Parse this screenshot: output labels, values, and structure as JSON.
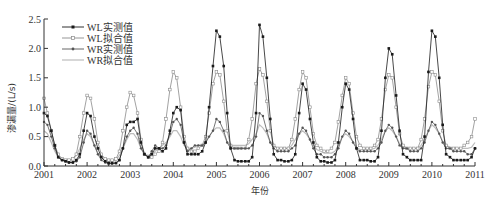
{
  "chart_data": {
    "type": "line",
    "title": "",
    "xlabel": "年份",
    "ylabel": "渗漏量/(L/s)",
    "xlim": [
      2001,
      2011
    ],
    "ylim": [
      0,
      2.5
    ],
    "xticks": [
      "2001",
      "2002",
      "2003",
      "2004",
      "2005",
      "2006",
      "2007",
      "2008",
      "2009",
      "2010",
      "2011"
    ],
    "yticks": [
      "0.0",
      "0.5",
      "1.0",
      "1.5",
      "2.0",
      "2.5"
    ],
    "grid": false,
    "legend_position": "upper-left",
    "x": [
      2001.0,
      2001.08,
      2001.17,
      2001.25,
      2001.33,
      2001.42,
      2001.5,
      2001.58,
      2001.67,
      2001.75,
      2001.83,
      2001.92,
      2002.0,
      2002.08,
      2002.17,
      2002.25,
      2002.33,
      2002.42,
      2002.5,
      2002.58,
      2002.67,
      2002.75,
      2002.83,
      2002.92,
      2003.0,
      2003.08,
      2003.17,
      2003.25,
      2003.33,
      2003.42,
      2003.5,
      2003.58,
      2003.67,
      2003.75,
      2003.83,
      2003.92,
      2004.0,
      2004.08,
      2004.17,
      2004.25,
      2004.33,
      2004.42,
      2004.5,
      2004.58,
      2004.67,
      2004.75,
      2004.83,
      2004.92,
      2005.0,
      2005.08,
      2005.17,
      2005.25,
      2005.33,
      2005.42,
      2005.5,
      2005.58,
      2005.67,
      2005.75,
      2005.83,
      2005.92,
      2006.0,
      2006.08,
      2006.17,
      2006.25,
      2006.33,
      2006.42,
      2006.5,
      2006.58,
      2006.67,
      2006.75,
      2006.83,
      2006.92,
      2007.0,
      2007.08,
      2007.17,
      2007.25,
      2007.33,
      2007.42,
      2007.5,
      2007.58,
      2007.67,
      2007.75,
      2007.83,
      2007.92,
      2008.0,
      2008.08,
      2008.17,
      2008.25,
      2008.33,
      2008.42,
      2008.5,
      2008.58,
      2008.67,
      2008.75,
      2008.83,
      2008.92,
      2009.0,
      2009.08,
      2009.17,
      2009.25,
      2009.33,
      2009.42,
      2009.5,
      2009.58,
      2009.67,
      2009.75,
      2009.83,
      2009.92,
      2010.0,
      2010.08,
      2010.17,
      2010.25,
      2010.33,
      2010.42,
      2010.5,
      2010.58,
      2010.67,
      2010.75,
      2010.83,
      2010.92,
      2011.0
    ],
    "series": [
      {
        "name": "WL实测值",
        "color": "#1a1a1a",
        "marker": "square",
        "values": [
          0.9,
          0.85,
          0.6,
          0.35,
          0.15,
          0.1,
          0.08,
          0.06,
          0.06,
          0.1,
          0.2,
          0.6,
          0.9,
          0.85,
          0.5,
          0.3,
          0.15,
          0.08,
          0.05,
          0.05,
          0.05,
          0.1,
          0.3,
          0.7,
          0.75,
          0.75,
          0.8,
          0.4,
          0.2,
          0.15,
          0.2,
          0.3,
          0.3,
          0.25,
          0.3,
          0.6,
          0.9,
          1.0,
          0.95,
          0.4,
          0.2,
          0.2,
          0.2,
          0.2,
          0.25,
          0.4,
          1.0,
          1.7,
          2.3,
          2.2,
          1.7,
          0.9,
          0.3,
          0.1,
          0.08,
          0.08,
          0.08,
          0.08,
          0.15,
          0.9,
          2.4,
          2.2,
          1.5,
          0.8,
          0.2,
          0.1,
          0.1,
          0.08,
          0.08,
          0.1,
          0.2,
          0.9,
          1.4,
          1.3,
          0.8,
          0.4,
          0.15,
          0.08,
          0.08,
          0.06,
          0.06,
          0.1,
          0.4,
          1.0,
          1.4,
          1.3,
          0.8,
          0.3,
          0.1,
          0.1,
          0.1,
          0.08,
          0.08,
          0.15,
          0.6,
          1.5,
          2.0,
          1.9,
          1.2,
          0.6,
          0.2,
          0.15,
          0.1,
          0.1,
          0.1,
          0.1,
          0.5,
          1.6,
          2.3,
          2.2,
          1.5,
          0.7,
          0.2,
          0.15,
          0.1,
          0.1,
          0.1,
          0.1,
          0.1,
          0.15,
          0.3
        ]
      },
      {
        "name": "WL拟合值",
        "color": "#8a8a8a",
        "marker": "open-square",
        "values": [
          1.15,
          0.9,
          0.6,
          0.35,
          0.2,
          0.12,
          0.1,
          0.1,
          0.12,
          0.2,
          0.5,
          0.9,
          1.2,
          1.15,
          0.8,
          0.4,
          0.2,
          0.12,
          0.1,
          0.1,
          0.12,
          0.25,
          0.6,
          1.0,
          1.25,
          1.2,
          0.9,
          0.45,
          0.2,
          0.15,
          0.15,
          0.2,
          0.25,
          0.4,
          0.8,
          1.3,
          1.6,
          1.5,
          1.0,
          0.5,
          0.3,
          0.25,
          0.25,
          0.3,
          0.35,
          0.5,
          0.9,
          1.4,
          1.6,
          1.55,
          1.1,
          0.6,
          0.35,
          0.3,
          0.3,
          0.3,
          0.3,
          0.45,
          0.8,
          1.4,
          1.65,
          1.55,
          1.1,
          0.6,
          0.35,
          0.3,
          0.3,
          0.3,
          0.3,
          0.45,
          0.8,
          1.3,
          1.6,
          1.5,
          1.0,
          0.55,
          0.35,
          0.3,
          0.25,
          0.25,
          0.3,
          0.4,
          0.75,
          1.2,
          1.5,
          1.4,
          0.9,
          0.5,
          0.35,
          0.3,
          0.3,
          0.3,
          0.35,
          0.45,
          0.8,
          1.3,
          1.55,
          1.5,
          1.0,
          0.55,
          0.35,
          0.3,
          0.3,
          0.3,
          0.3,
          0.45,
          0.8,
          1.35,
          1.6,
          1.55,
          1.1,
          0.6,
          0.35,
          0.3,
          0.3,
          0.3,
          0.3,
          0.35,
          0.4,
          0.5,
          0.8
        ]
      },
      {
        "name": "WR实测值",
        "color": "#555555",
        "marker": "star",
        "values": [
          0.75,
          0.7,
          0.5,
          0.3,
          0.15,
          0.1,
          0.08,
          0.06,
          0.06,
          0.08,
          0.15,
          0.4,
          0.6,
          0.55,
          0.35,
          0.2,
          0.1,
          0.06,
          0.04,
          0.04,
          0.05,
          0.1,
          0.3,
          0.5,
          0.6,
          0.65,
          0.55,
          0.3,
          0.2,
          0.15,
          0.25,
          0.35,
          0.3,
          0.3,
          0.35,
          0.55,
          0.75,
          0.8,
          0.7,
          0.4,
          0.25,
          0.3,
          0.35,
          0.35,
          0.35,
          0.4,
          0.5,
          0.6,
          0.8,
          0.75,
          0.6,
          0.4,
          0.3,
          0.3,
          0.3,
          0.3,
          0.3,
          0.3,
          0.35,
          0.5,
          0.9,
          0.85,
          0.6,
          0.4,
          0.3,
          0.25,
          0.25,
          0.25,
          0.25,
          0.3,
          0.35,
          0.55,
          0.65,
          0.6,
          0.45,
          0.3,
          0.2,
          0.2,
          0.15,
          0.15,
          0.15,
          0.2,
          0.3,
          0.5,
          0.6,
          0.55,
          0.4,
          0.3,
          0.25,
          0.25,
          0.25,
          0.25,
          0.25,
          0.3,
          0.4,
          0.6,
          0.7,
          0.65,
          0.5,
          0.35,
          0.3,
          0.3,
          0.25,
          0.25,
          0.25,
          0.3,
          0.4,
          0.6,
          0.75,
          0.7,
          0.55,
          0.4,
          0.3,
          0.3,
          0.25,
          0.25,
          0.25,
          0.25,
          0.2,
          0.2,
          0.3
        ]
      },
      {
        "name": "WR拟合值",
        "color": "#bdbdbd",
        "marker": "none",
        "values": [
          0.6,
          0.55,
          0.4,
          0.25,
          0.15,
          0.12,
          0.1,
          0.1,
          0.12,
          0.18,
          0.3,
          0.45,
          0.55,
          0.5,
          0.35,
          0.22,
          0.14,
          0.1,
          0.08,
          0.08,
          0.1,
          0.18,
          0.3,
          0.45,
          0.55,
          0.55,
          0.45,
          0.3,
          0.2,
          0.18,
          0.2,
          0.25,
          0.3,
          0.35,
          0.4,
          0.5,
          0.6,
          0.6,
          0.5,
          0.35,
          0.3,
          0.3,
          0.32,
          0.35,
          0.35,
          0.4,
          0.5,
          0.6,
          0.65,
          0.65,
          0.55,
          0.4,
          0.35,
          0.35,
          0.35,
          0.35,
          0.35,
          0.38,
          0.45,
          0.55,
          0.7,
          0.65,
          0.55,
          0.4,
          0.35,
          0.3,
          0.3,
          0.3,
          0.3,
          0.35,
          0.45,
          0.55,
          0.6,
          0.55,
          0.45,
          0.35,
          0.28,
          0.25,
          0.22,
          0.22,
          0.22,
          0.25,
          0.35,
          0.5,
          0.55,
          0.5,
          0.42,
          0.32,
          0.28,
          0.28,
          0.28,
          0.28,
          0.3,
          0.35,
          0.45,
          0.6,
          0.65,
          0.6,
          0.5,
          0.38,
          0.32,
          0.3,
          0.3,
          0.3,
          0.3,
          0.35,
          0.45,
          0.6,
          0.7,
          0.65,
          0.55,
          0.42,
          0.35,
          0.32,
          0.3,
          0.3,
          0.3,
          0.3,
          0.3,
          0.32,
          0.4
        ]
      }
    ]
  }
}
